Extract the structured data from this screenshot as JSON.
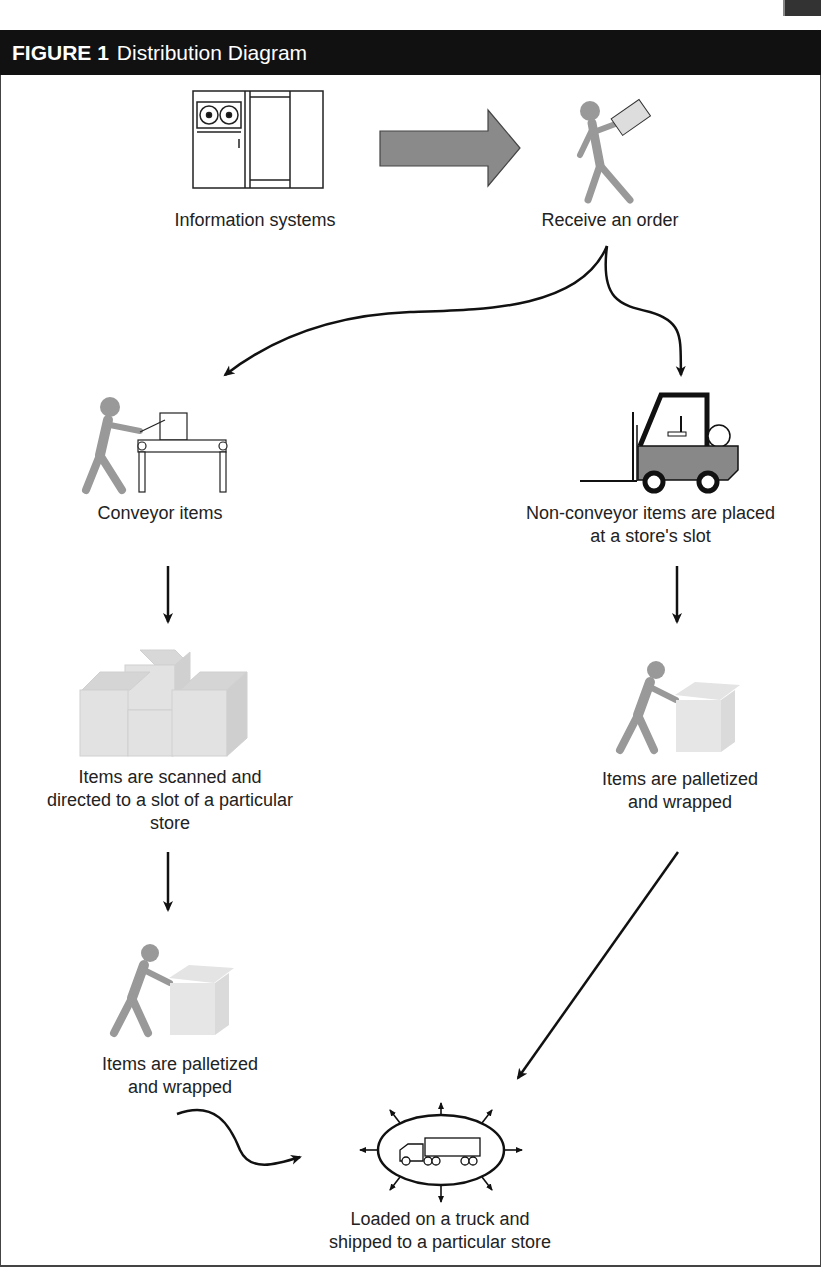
{
  "figure": {
    "number_label": "FIGURE 1",
    "title": "Distribution Diagram"
  },
  "nodes": {
    "information_systems": "Information systems",
    "receive_order": "Receive an order",
    "conveyor_items": "Conveyor items",
    "non_conveyor_line1": "Non-conveyor items are placed",
    "non_conveyor_line2": "at a store's slot",
    "scanned_line1": "Items are scanned and",
    "scanned_line2": "directed to a slot of a particular",
    "scanned_line3": "store",
    "palletized_right_line1": "Items are palletized",
    "palletized_right_line2": "and wrapped",
    "palletized_left_line1": "Items are palletized",
    "palletized_left_line2": "and wrapped",
    "truck_line1": "Loaded on a truck and",
    "truck_line2": "shipped to a particular store"
  },
  "colors": {
    "header_bg": "#111111",
    "figure_gray": "#999999",
    "arrow_fill": "#8a8a8a",
    "box_gray": "#dcdcdc"
  }
}
